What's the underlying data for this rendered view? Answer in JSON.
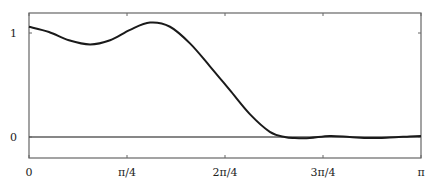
{
  "chart_data": {
    "type": "line",
    "title": "",
    "xlabel": "",
    "ylabel": "",
    "xlim": [
      0,
      3.14159
    ],
    "ylim": [
      -0.2,
      1.25
    ],
    "grid": false,
    "legend": null,
    "x_ticks": [
      {
        "value": 0,
        "label": "0"
      },
      {
        "value": 0.7854,
        "label": "π/4"
      },
      {
        "value": 1.5708,
        "label": "2π/4"
      },
      {
        "value": 2.3562,
        "label": "3π/4"
      },
      {
        "value": 3.14159,
        "label": "π"
      }
    ],
    "y_ticks": [
      {
        "value": 0,
        "label": "0"
      },
      {
        "value": 1,
        "label": "1"
      }
    ],
    "reference_lines": [
      {
        "orientation": "horizontal",
        "y": 0
      }
    ],
    "series": [
      {
        "name": "curve",
        "color": "#1a1a1a",
        "x": [
          0,
          0.16,
          0.32,
          0.49,
          0.65,
          0.81,
          0.97,
          1.13,
          1.29,
          1.45,
          1.61,
          1.77,
          1.93,
          2.05,
          2.13,
          2.25,
          2.41,
          2.57,
          2.73,
          2.89,
          3.05,
          3.14159
        ],
        "y": [
          1.06,
          1.01,
          0.93,
          0.89,
          0.93,
          1.03,
          1.1,
          1.06,
          0.9,
          0.68,
          0.45,
          0.22,
          0.05,
          0.0,
          -0.01,
          -0.01,
          0.01,
          0.0,
          -0.01,
          -0.005,
          0.005,
          0.01
        ]
      }
    ]
  }
}
